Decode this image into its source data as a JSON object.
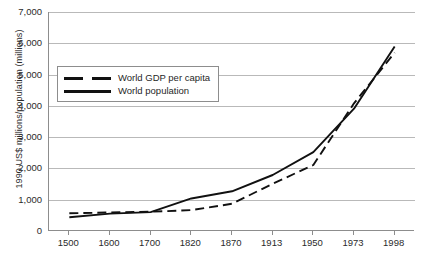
{
  "chart_data": {
    "type": "line",
    "title": "",
    "xlabel": "",
    "ylabel": "1990 US$ millions/population (millions)",
    "categories": [
      "1500",
      "1600",
      "1700",
      "1820",
      "1870",
      "1913",
      "1950",
      "1973",
      "1998"
    ],
    "ylim": [
      0,
      7000
    ],
    "yticks": [
      "0",
      "1,000",
      "2,000",
      "3,000",
      "4,000",
      "5,000",
      "6,000",
      "7,000"
    ],
    "ytick_values": [
      0,
      1000,
      2000,
      3000,
      4000,
      5000,
      6000,
      7000
    ],
    "grid": true,
    "legend_position": "upper-left-inside",
    "series": [
      {
        "name": "World GDP per capita",
        "style": "dashed",
        "color": "#111111",
        "values": [
          565,
          593,
          615,
          667,
          870,
          1510,
          2110,
          4080,
          5700
        ]
      },
      {
        "name": "World population",
        "style": "solid",
        "color": "#111111",
        "values": [
          438,
          556,
          603,
          1040,
          1270,
          1790,
          2520,
          3910,
          5900
        ]
      }
    ]
  },
  "legend": {
    "items": [
      {
        "label": "World GDP per capita",
        "style": "dashed"
      },
      {
        "label": "World population",
        "style": "solid"
      }
    ]
  },
  "caption": {
    "text": ""
  }
}
